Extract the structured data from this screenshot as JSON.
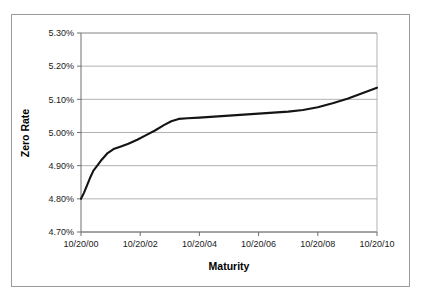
{
  "chart_data": {
    "type": "line",
    "title": "",
    "xlabel": "Maturity",
    "ylabel": "Zero Rate",
    "grid": true,
    "legend": false,
    "ylim": [
      4.7,
      5.3
    ],
    "ytick_values": [
      4.7,
      4.8,
      4.9,
      5.0,
      5.1,
      5.2,
      5.3
    ],
    "ytick_labels": [
      "4.70%",
      "4.80%",
      "4.90%",
      "5.00%",
      "5.10%",
      "5.20%",
      "5.30%"
    ],
    "xlim": [
      0,
      10
    ],
    "xtick_values": [
      0,
      2,
      4,
      6,
      8,
      10
    ],
    "xtick_labels": [
      "10/20/00",
      "10/20/02",
      "10/20/04",
      "10/20/06",
      "10/20/08",
      "10/20/10"
    ],
    "series": [
      {
        "name": "Zero Rate",
        "color": "#141414",
        "x": [
          0.0,
          0.1,
          0.2,
          0.3,
          0.42,
          0.55,
          0.7,
          0.9,
          1.1,
          1.35,
          1.6,
          1.9,
          2.2,
          2.5,
          2.8,
          3.05,
          3.3,
          3.6,
          4.0,
          4.5,
          5.0,
          5.5,
          6.0,
          6.5,
          7.0,
          7.5,
          8.0,
          8.5,
          9.0,
          9.5,
          10.0
        ],
        "y": [
          4.8,
          4.818,
          4.84,
          4.862,
          4.885,
          4.9,
          4.918,
          4.938,
          4.95,
          4.958,
          4.966,
          4.978,
          4.992,
          5.006,
          5.022,
          5.034,
          5.041,
          5.043,
          5.045,
          5.048,
          5.051,
          5.054,
          5.057,
          5.06,
          5.063,
          5.068,
          5.076,
          5.088,
          5.102,
          5.118,
          5.135
        ]
      }
    ]
  },
  "labels": {
    "y_axis_title": "Zero Rate",
    "x_axis_title": "Maturity"
  }
}
